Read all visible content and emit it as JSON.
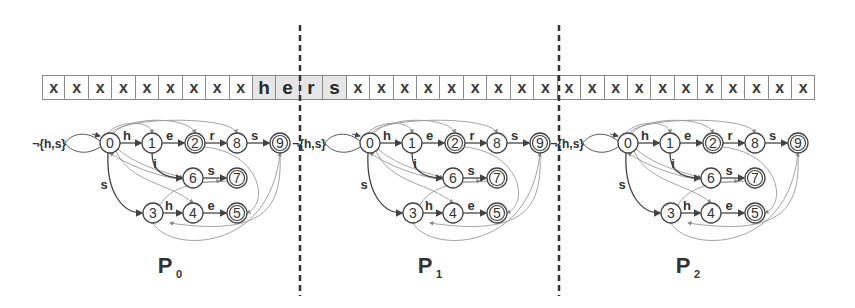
{
  "tape": {
    "cells": [
      "x",
      "x",
      "x",
      "x",
      "x",
      "x",
      "x",
      "x",
      "x",
      "h",
      "e",
      "r",
      "s",
      "x",
      "x",
      "x",
      "x",
      "x",
      "x",
      "x",
      "x",
      "x",
      "x",
      "x",
      "x",
      "x",
      "x",
      "x",
      "x",
      "x",
      "x",
      "x",
      "x"
    ],
    "highlighted_indices": [
      9,
      10,
      11,
      12
    ],
    "highlight_color": "#e6e6e6"
  },
  "dividers": [
    {
      "x": 300
    },
    {
      "x": 559
    }
  ],
  "automaton": {
    "start_loop_label": "¬{h,s}",
    "nodes": [
      {
        "id": "0",
        "x": 0,
        "y": 0,
        "accepting": false
      },
      {
        "id": "1",
        "x": 42,
        "y": 0,
        "accepting": false
      },
      {
        "id": "2",
        "x": 85,
        "y": 0,
        "accepting": true
      },
      {
        "id": "8",
        "x": 127,
        "y": 0,
        "accepting": false
      },
      {
        "id": "9",
        "x": 170,
        "y": 0,
        "accepting": true
      },
      {
        "id": "6",
        "x": 83,
        "y": 35,
        "accepting": false
      },
      {
        "id": "7",
        "x": 127,
        "y": 35,
        "accepting": true
      },
      {
        "id": "3",
        "x": 43,
        "y": 70,
        "accepting": false
      },
      {
        "id": "4",
        "x": 83,
        "y": 70,
        "accepting": false
      },
      {
        "id": "5",
        "x": 127,
        "y": 70,
        "accepting": true
      }
    ],
    "edges": [
      {
        "from": "0",
        "to": "1",
        "label": "h"
      },
      {
        "from": "1",
        "to": "2",
        "label": "e"
      },
      {
        "from": "2",
        "to": "8",
        "label": "r"
      },
      {
        "from": "8",
        "to": "9",
        "label": "s"
      },
      {
        "from": "1",
        "to": "6",
        "label": "i"
      },
      {
        "from": "6",
        "to": "7",
        "label": "s"
      },
      {
        "from": "0",
        "to": "3",
        "label": "s"
      },
      {
        "from": "3",
        "to": "4",
        "label": "h"
      },
      {
        "from": "4",
        "to": "5",
        "label": "e"
      }
    ]
  },
  "panels": [
    {
      "name": "P",
      "sub": "0",
      "origin_x": 110,
      "origin_y": 143
    },
    {
      "name": "P",
      "sub": "1",
      "origin_x": 370,
      "origin_y": 143
    },
    {
      "name": "P",
      "sub": "2",
      "origin_x": 628,
      "origin_y": 143
    }
  ]
}
